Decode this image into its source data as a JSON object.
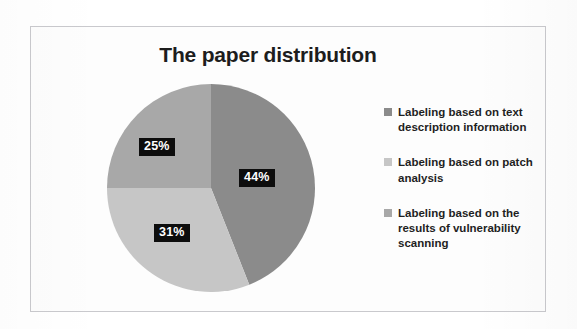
{
  "chart_data": {
    "type": "pie",
    "title": "The paper distribution",
    "xlabel": "",
    "ylabel": "",
    "legend_position": "right",
    "grid": false,
    "categories": [
      "Labeling based on text description information",
      "Labeling based on patch analysis",
      "Labeling based on the results of vulnerability scanning"
    ],
    "values": [
      44,
      31,
      25
    ],
    "value_labels": [
      "44%",
      "31%",
      "25%"
    ],
    "unit": "%",
    "colors": [
      "#8b8b8b",
      "#c6c6c6",
      "#a8a8a8"
    ],
    "slices": [
      {
        "label": "Labeling based on text description information",
        "value": 44,
        "display": "44%",
        "color": "#8b8b8b"
      },
      {
        "label": "Labeling based on patch analysis",
        "value": 31,
        "display": "31%",
        "color": "#c6c6c6"
      },
      {
        "label": "Labeling based on the results of vulnerability scanning",
        "value": 25,
        "display": "25%",
        "color": "#a8a8a8"
      }
    ]
  },
  "figure": {
    "title": "The paper distribution",
    "border_color": "#c9c9cd",
    "background": "#fdfdfd"
  },
  "legend": {
    "items": [
      {
        "label": "Labeling based on text description information",
        "color": "#8b8b8b"
      },
      {
        "label": "Labeling based on patch analysis",
        "color": "#c6c6c6"
      },
      {
        "label": "Labeling based on the results of vulnerability scanning",
        "color": "#a8a8a8"
      }
    ]
  },
  "labels": {
    "slice_0": "44%",
    "slice_1": "31%",
    "slice_2": "25%"
  }
}
